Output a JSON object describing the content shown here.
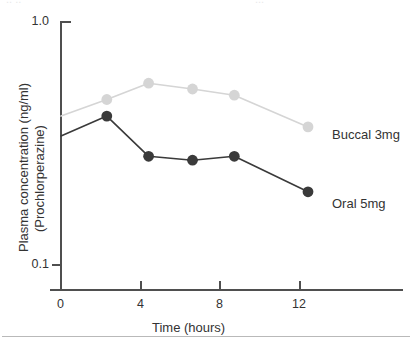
{
  "chart_data": {
    "type": "line",
    "title": "",
    "xlabel": "Time (hours)",
    "ylabel": "Plasma concentration (ng/ml)",
    "ylabel_line2": "(Prochlorperazine)",
    "yscale": "log",
    "ylim": [
      0.1,
      1.0
    ],
    "xlim": [
      -0.55,
      13.2
    ],
    "xticks": [
      0,
      4,
      8,
      12
    ],
    "xticklabels": [
      "0",
      "4",
      "8",
      "12"
    ],
    "yticks": [
      0.1,
      1.0
    ],
    "yticklabels": [
      "0.1",
      "1.0"
    ],
    "grid": false,
    "legend_position": "right-of-line-ends",
    "series": [
      {
        "name": "Buccal 3mg",
        "label": "Buccal 3mg",
        "color": "#d5d5d5",
        "marker": "circle",
        "x": [
          0.0,
          2.3,
          4.4,
          6.6,
          8.7,
          12.4
        ],
        "y": [
          0.41,
          0.48,
          0.56,
          0.53,
          0.5,
          0.37
        ]
      },
      {
        "name": "Oral 5mg",
        "label": "Oral 5mg",
        "color": "#3a3a3a",
        "marker": "circle",
        "x": [
          0.0,
          2.3,
          4.4,
          6.6,
          8.7,
          12.4
        ],
        "y": [
          0.34,
          0.41,
          0.28,
          0.27,
          0.28,
          0.2
        ]
      }
    ]
  },
  "axes": {
    "y_tick_top": "1.0",
    "y_tick_bottom": "0.1",
    "x_tick_0": "0",
    "x_tick_4": "4",
    "x_tick_8": "8",
    "x_tick_12": "12",
    "x_title": "Time (hours)",
    "y_title_line1": "Plasma concentration (ng/ml)",
    "y_title_line2": "(Prochlorperazine)"
  },
  "labels": {
    "buccal": "Buccal 3mg",
    "oral": "Oral 5mg"
  },
  "colors": {
    "buccal": "#d5d5d5",
    "oral": "#3a3a3a",
    "axis": "#4f4f4f",
    "text": "#333333",
    "rule": "#b9b9b9",
    "background": "#ffffff"
  },
  "cropped_text_above": {
    "fragment_left": "..  ..",
    "fragment_right": "..."
  }
}
